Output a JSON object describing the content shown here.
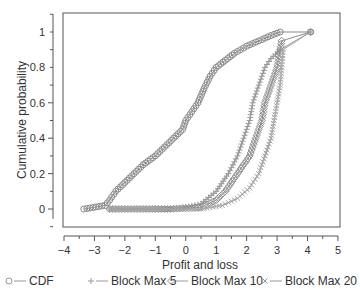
{
  "chart_data": {
    "type": "line",
    "title": "",
    "xlabel": "Profit and loss",
    "ylabel": "Cumulative probability",
    "xlim": [
      -4,
      5
    ],
    "ylim": [
      -0.05,
      1.1
    ],
    "x_ticks": [
      -4,
      -3,
      -2,
      -1,
      0,
      1,
      2,
      3,
      4,
      5
    ],
    "y_ticks": [
      0,
      0.2,
      0.4,
      0.6,
      0.8,
      1
    ],
    "y_tick_labels": [
      "0",
      "0.2",
      "0.4",
      "0.6",
      "0.8",
      "1"
    ],
    "grid": false,
    "legend_position": "bottom",
    "series": [
      {
        "name": "CDF",
        "marker": "circle",
        "color": "#8a8a8a",
        "points": [
          [
            -3.35,
            0
          ],
          [
            -2.65,
            0.02
          ],
          [
            -2.5,
            0.05
          ],
          [
            -2.3,
            0.1
          ],
          [
            -2.0,
            0.15
          ],
          [
            -1.7,
            0.2
          ],
          [
            -1.4,
            0.25
          ],
          [
            -1.0,
            0.3
          ],
          [
            -0.7,
            0.35
          ],
          [
            -0.4,
            0.4
          ],
          [
            -0.1,
            0.45
          ],
          [
            0.0,
            0.5
          ],
          [
            0.2,
            0.55
          ],
          [
            0.4,
            0.6
          ],
          [
            0.6,
            0.68
          ],
          [
            0.8,
            0.75
          ],
          [
            1.0,
            0.8
          ],
          [
            1.3,
            0.84
          ],
          [
            1.6,
            0.88
          ],
          [
            2.0,
            0.92
          ],
          [
            2.4,
            0.95
          ],
          [
            2.8,
            0.98
          ],
          [
            3.1,
            1.0
          ],
          [
            4.1,
            1.0
          ]
        ]
      },
      {
        "name": "Block Max 5",
        "marker": "plus",
        "color": "#9a9a9a",
        "points": [
          [
            -2.5,
            0
          ],
          [
            -1.5,
            0
          ],
          [
            -0.5,
            0
          ],
          [
            0.0,
            0.01
          ],
          [
            0.5,
            0.03
          ],
          [
            1.0,
            0.1
          ],
          [
            1.4,
            0.2
          ],
          [
            1.7,
            0.3
          ],
          [
            1.9,
            0.4
          ],
          [
            2.1,
            0.5
          ],
          [
            2.2,
            0.6
          ],
          [
            2.4,
            0.7
          ],
          [
            2.6,
            0.8
          ],
          [
            2.8,
            0.85
          ],
          [
            3.1,
            0.9
          ],
          [
            4.1,
            1.0
          ]
        ]
      },
      {
        "name": "Block Max 10",
        "marker": "diamond",
        "color": "#8c8c8c",
        "points": [
          [
            -2.5,
            0
          ],
          [
            -1.5,
            0
          ],
          [
            -0.5,
            0
          ],
          [
            0.5,
            0.01
          ],
          [
            1.0,
            0.05
          ],
          [
            1.3,
            0.1
          ],
          [
            1.7,
            0.2
          ],
          [
            2.1,
            0.3
          ],
          [
            2.3,
            0.4
          ],
          [
            2.5,
            0.5
          ],
          [
            2.6,
            0.6
          ],
          [
            2.8,
            0.7
          ],
          [
            3.0,
            0.8
          ],
          [
            3.1,
            0.9
          ],
          [
            3.15,
            0.95
          ],
          [
            4.1,
            1.0
          ]
        ]
      },
      {
        "name": "Block Max 20",
        "marker": "cross",
        "color": "#a5a5a5",
        "points": [
          [
            -2.5,
            0
          ],
          [
            -1.0,
            0
          ],
          [
            0.5,
            0
          ],
          [
            1.2,
            0.02
          ],
          [
            1.7,
            0.06
          ],
          [
            2.1,
            0.12
          ],
          [
            2.4,
            0.2
          ],
          [
            2.6,
            0.3
          ],
          [
            2.8,
            0.4
          ],
          [
            2.9,
            0.5
          ],
          [
            3.0,
            0.6
          ],
          [
            3.1,
            0.7
          ],
          [
            3.15,
            0.8
          ],
          [
            3.2,
            0.9
          ],
          [
            4.1,
            1.0
          ]
        ]
      }
    ]
  },
  "legend": [
    {
      "label": "CDF",
      "marker": "circle"
    },
    {
      "label": "Block Max 5",
      "marker": "plus"
    },
    {
      "label": "Block Max 10",
      "marker": "diamond"
    },
    {
      "label": "Block Max 20",
      "marker": "cross"
    }
  ],
  "axes": {
    "xlabel": "Profit and loss",
    "ylabel": "Cumulative probability"
  }
}
